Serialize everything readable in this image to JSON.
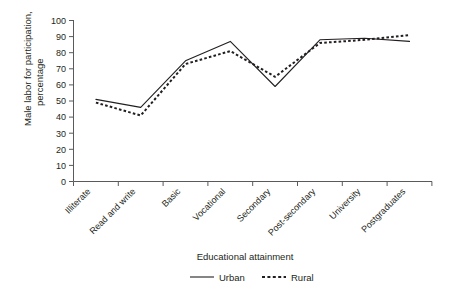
{
  "chart_data": {
    "type": "line",
    "title": "",
    "xlabel": "Educational attainment",
    "ylabel": "Male labor for participation, percentage",
    "ylabel_line1": "Male labor for participation,",
    "ylabel_line2": "percentage",
    "categories": [
      "Illiterate",
      "Read and write",
      "Basic",
      "Vocational",
      "Secondary",
      "Post-secondary",
      "University",
      "Postgraduates"
    ],
    "series": [
      {
        "name": "Urban",
        "style": "solid",
        "values": [
          51,
          46,
          75,
          87,
          59,
          88,
          89,
          87
        ]
      },
      {
        "name": "Rural",
        "style": "dashed",
        "values": [
          49,
          41,
          73,
          81,
          65,
          86,
          88,
          91
        ]
      }
    ],
    "ylim": [
      0,
      100
    ],
    "ytick_step": 10,
    "yticks": [
      "100",
      "90",
      "80",
      "70",
      "60",
      "50",
      "40",
      "30",
      "20",
      "10",
      "0"
    ],
    "grid": false,
    "legend_position": "bottom",
    "legend": [
      {
        "label": "Urban",
        "style": "solid"
      },
      {
        "label": "Rural",
        "style": "dashed"
      }
    ],
    "colors": {
      "line": "#231f20",
      "axis": "#5a5a5a",
      "background": "#ffffff"
    }
  }
}
